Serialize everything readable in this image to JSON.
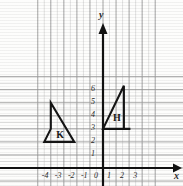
{
  "chart_data": {
    "type": "scatter",
    "title": "",
    "xlabel": "x",
    "ylabel": "y",
    "grid": true,
    "legend_position": "none",
    "xlim": [
      -4.8,
      3.3
    ],
    "ylim": [
      -0.6,
      6.9
    ],
    "x_ticks": [
      -4,
      -3,
      -2,
      -1,
      0,
      1,
      2,
      3
    ],
    "y_ticks": [
      0,
      1,
      2,
      3,
      4,
      5,
      6
    ],
    "x_tick_labels": [
      "-4",
      "-3",
      "-2",
      "-1",
      "0",
      "1",
      "2",
      "3"
    ],
    "y_tick_labels": [
      "0",
      "1",
      "2",
      "3",
      "4",
      "5",
      "6"
    ],
    "grid_step": 0.5,
    "shapes": [
      {
        "name": "K",
        "label": "K",
        "label_x": -3.35,
        "label_y": 2.55,
        "type": "polygon",
        "points": [
          [
            -4,
            5
          ],
          [
            -4,
            3
          ],
          [
            -4.5,
            2
          ],
          [
            -2.2,
            2
          ]
        ],
        "closed": true
      },
      {
        "name": "H",
        "label": "H",
        "label_x": 1.0,
        "label_y": 3.85,
        "type": "polygon",
        "points": [
          [
            0,
            3
          ],
          [
            1.6,
            6.3
          ],
          [
            1.6,
            3
          ],
          [
            2.1,
            3
          ]
        ],
        "closed": true
      }
    ]
  },
  "axes": {
    "x_axis_name": "x",
    "y_axis_name": "y",
    "origin_label": "0"
  }
}
